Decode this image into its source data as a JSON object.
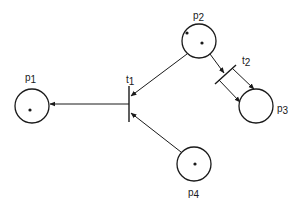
{
  "diagram": {
    "type": "petri-net",
    "colors": {
      "stroke": "#1a1a1a",
      "background": "#ffffff"
    },
    "places": [
      {
        "id": "p1",
        "label": "p",
        "subscript": "1",
        "tokens": 1
      },
      {
        "id": "p2",
        "label": "p",
        "subscript": "2",
        "tokens": 2
      },
      {
        "id": "p3",
        "label": "p",
        "subscript": "3",
        "tokens": 0
      },
      {
        "id": "p4",
        "label": "p",
        "subscript": "4",
        "tokens": 1
      }
    ],
    "transitions": [
      {
        "id": "t1",
        "label": "t",
        "subscript": "1"
      },
      {
        "id": "t2",
        "label": "t",
        "subscript": "2"
      }
    ],
    "arcs": [
      {
        "from": "p2",
        "to": "t1"
      },
      {
        "from": "p4",
        "to": "t1"
      },
      {
        "from": "t1",
        "to": "p1"
      },
      {
        "from": "p2",
        "to": "t2"
      },
      {
        "from": "t2",
        "to": "p3",
        "multiplicity": 2
      }
    ]
  }
}
